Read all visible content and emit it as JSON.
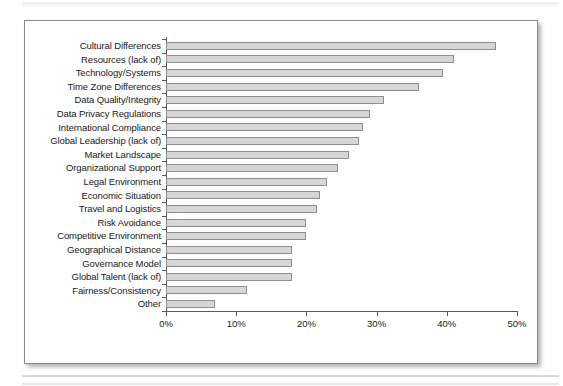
{
  "frame": {
    "border_color": "#8a8a8a",
    "background": "#ffffff"
  },
  "chart_data": {
    "type": "bar",
    "orientation": "horizontal",
    "title": "",
    "subtitle": "",
    "xlabel": "",
    "ylabel": "",
    "xlim": [
      0,
      50
    ],
    "xtick_labels": [
      "0%",
      "10%",
      "20%",
      "30%",
      "40%",
      "50%"
    ],
    "xticks": [
      0,
      10,
      20,
      30,
      40,
      50
    ],
    "grid": false,
    "legend": null,
    "bar_color": "#d6d6d6",
    "bar_border_color": "#8f8f8f",
    "categories": [
      "Cultural Differences",
      "Resources (lack of)",
      "Technology/Systems",
      "Time Zone Differences",
      "Data Quality/Integrity",
      "Data Privacy Regulations",
      "International Compliance",
      "Global Leadership (lack of)",
      "Market Landscape",
      "Organizational Support",
      "Legal Environment",
      "Economic Situation",
      "Travel and Logistics",
      "Risk Avoidance",
      "Competitive Environment",
      "Geographical Distance",
      "Governance Model",
      "Global Talent (lack of)",
      "Fairness/Consistency",
      "Other"
    ],
    "values": [
      47,
      41,
      39.5,
      36,
      31,
      29,
      28,
      27.5,
      26,
      24.5,
      23,
      22,
      21.5,
      20,
      20,
      18,
      18,
      18,
      11.5,
      7
    ]
  }
}
